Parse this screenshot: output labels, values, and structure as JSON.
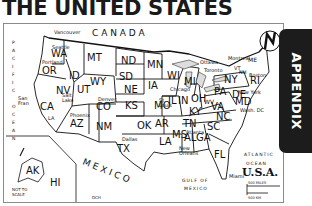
{
  "page": {
    "title": "THE UNITED STATES",
    "side_tab": "APPENDIX"
  },
  "map": {
    "country_label": "U.S.A.",
    "neighbors": {
      "north": "CANADA",
      "south": "MEXICO"
    },
    "water_bodies": {
      "pacific": "PACIFIC OCEAN",
      "atlantic_line1": "ATLANTIC",
      "atlantic_line2": "OCEAN",
      "gulf_line1": "GULF OF",
      "gulf_line2": "MEXICO"
    },
    "states": [
      "WA",
      "OR",
      "CA",
      "ID",
      "NV",
      "UT",
      "AZ",
      "MT",
      "WY",
      "CO",
      "NM",
      "ND",
      "SD",
      "NE",
      "KS",
      "OK",
      "TX",
      "MN",
      "IA",
      "MO",
      "AR",
      "LA",
      "WI",
      "IL",
      "MS",
      "MI",
      "IN",
      "KY",
      "TN",
      "AL",
      "OH",
      "GA",
      "FL",
      "SC",
      "NC",
      "VA",
      "WV",
      "PA",
      "NY",
      "VT",
      "NH",
      "ME",
      "MA",
      "RI",
      "CT",
      "NJ",
      "DE",
      "MD",
      "AK",
      "HI"
    ],
    "cities": [
      "Vancouver",
      "Seattle",
      "Portland",
      "San Fran",
      "Salt Lake",
      "Denver",
      "LA",
      "Phoenix",
      "Dallas",
      "Chicago",
      "St Louis",
      "Atlanta",
      "New Orleans",
      "Miami",
      "Ottawa",
      "Toronto",
      "Montreal",
      "Boston",
      "New York",
      "Wash. DC"
    ],
    "insets_note_line1": "NOT TO",
    "insets_note_line2": "SCALE",
    "scale": {
      "miles": "500 MILES",
      "km": "500 KM"
    },
    "compass": "N",
    "credit": "DCH"
  }
}
